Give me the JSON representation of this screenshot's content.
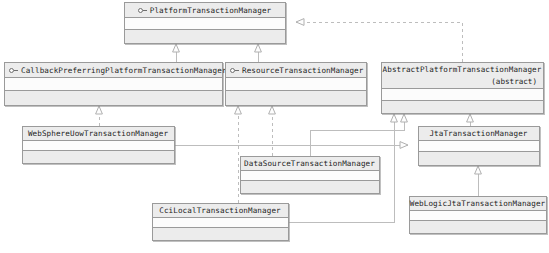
{
  "diagram": {
    "kind": "uml-class-diagram",
    "colors": {
      "box_border": "#9a9a9a",
      "header_fill": "#ececec",
      "compartment_fill": "#fcfcfc",
      "footer_fill": "#ececec",
      "edge": "#b6b6b6",
      "text": "#1d1d1d"
    },
    "nodes": [
      {
        "id": "platform-transaction-manager",
        "name": "PlatformTransactionManager",
        "stereotype": "interface",
        "icon": "interface-icon",
        "abstract_label": "",
        "x": 124,
        "y": 2,
        "w": 162,
        "h": 42,
        "title_align": "center"
      },
      {
        "id": "callback-preferring-platform-transaction-manager",
        "name": "CallbackPreferringPlatformTransactionManager",
        "stereotype": "interface",
        "icon": "interface-icon",
        "abstract_label": "",
        "x": 4,
        "y": 62,
        "w": 219,
        "h": 44,
        "title_align": "left"
      },
      {
        "id": "resource-transaction-manager",
        "name": "ResourceTransactionManager",
        "stereotype": "interface",
        "icon": "interface-icon",
        "abstract_label": "",
        "x": 225,
        "y": 62,
        "w": 142,
        "h": 44,
        "title_align": "left"
      },
      {
        "id": "abstract-platform-transaction-manager",
        "name": "AbstractPlatformTransactionManager",
        "stereotype": "abstract-class",
        "icon": "",
        "abstract_label": "(abstract)",
        "x": 381,
        "y": 62,
        "w": 163,
        "h": 52,
        "title_align": "center"
      },
      {
        "id": "websphere-uow-transaction-manager",
        "name": "WebSphereUowTransactionManager",
        "stereotype": "class",
        "icon": "",
        "abstract_label": "",
        "x": 22,
        "y": 126,
        "w": 153,
        "h": 38,
        "title_align": "center"
      },
      {
        "id": "jta-transaction-manager",
        "name": "JtaTransactionManager",
        "stereotype": "class",
        "icon": "",
        "abstract_label": "",
        "x": 418,
        "y": 126,
        "w": 122,
        "h": 40,
        "title_align": "center"
      },
      {
        "id": "datasource-transaction-manager",
        "name": "DataSourceTransactionManager",
        "stereotype": "class",
        "icon": "",
        "abstract_label": "",
        "x": 240,
        "y": 156,
        "w": 140,
        "h": 38,
        "title_align": "center"
      },
      {
        "id": "cci-local-transaction-manager",
        "name": "CciLocalTransactionManager",
        "stereotype": "class",
        "icon": "",
        "abstract_label": "",
        "x": 152,
        "y": 203,
        "w": 137,
        "h": 38,
        "title_align": "center"
      },
      {
        "id": "weblogic-jta-transaction-manager",
        "name": "WebLogicJtaTransactionManager",
        "stereotype": "class",
        "icon": "",
        "abstract_label": "",
        "x": 409,
        "y": 196,
        "w": 138,
        "h": 38,
        "title_align": "center"
      }
    ],
    "edges": [
      {
        "from": "callback-preferring-platform-transaction-manager",
        "to": "platform-transaction-manager",
        "type": "generalization"
      },
      {
        "from": "resource-transaction-manager",
        "to": "platform-transaction-manager",
        "type": "generalization"
      },
      {
        "from": "abstract-platform-transaction-manager",
        "to": "platform-transaction-manager",
        "type": "realization"
      },
      {
        "from": "websphere-uow-transaction-manager",
        "to": "callback-preferring-platform-transaction-manager",
        "type": "realization"
      },
      {
        "from": "websphere-uow-transaction-manager",
        "to": "jta-transaction-manager",
        "type": "generalization"
      },
      {
        "from": "datasource-transaction-manager",
        "to": "resource-transaction-manager",
        "type": "realization"
      },
      {
        "from": "datasource-transaction-manager",
        "to": "abstract-platform-transaction-manager",
        "type": "generalization"
      },
      {
        "from": "cci-local-transaction-manager",
        "to": "resource-transaction-manager",
        "type": "realization"
      },
      {
        "from": "cci-local-transaction-manager",
        "to": "abstract-platform-transaction-manager",
        "type": "generalization"
      },
      {
        "from": "jta-transaction-manager",
        "to": "abstract-platform-transaction-manager",
        "type": "generalization"
      },
      {
        "from": "weblogic-jta-transaction-manager",
        "to": "jta-transaction-manager",
        "type": "generalization"
      }
    ]
  }
}
